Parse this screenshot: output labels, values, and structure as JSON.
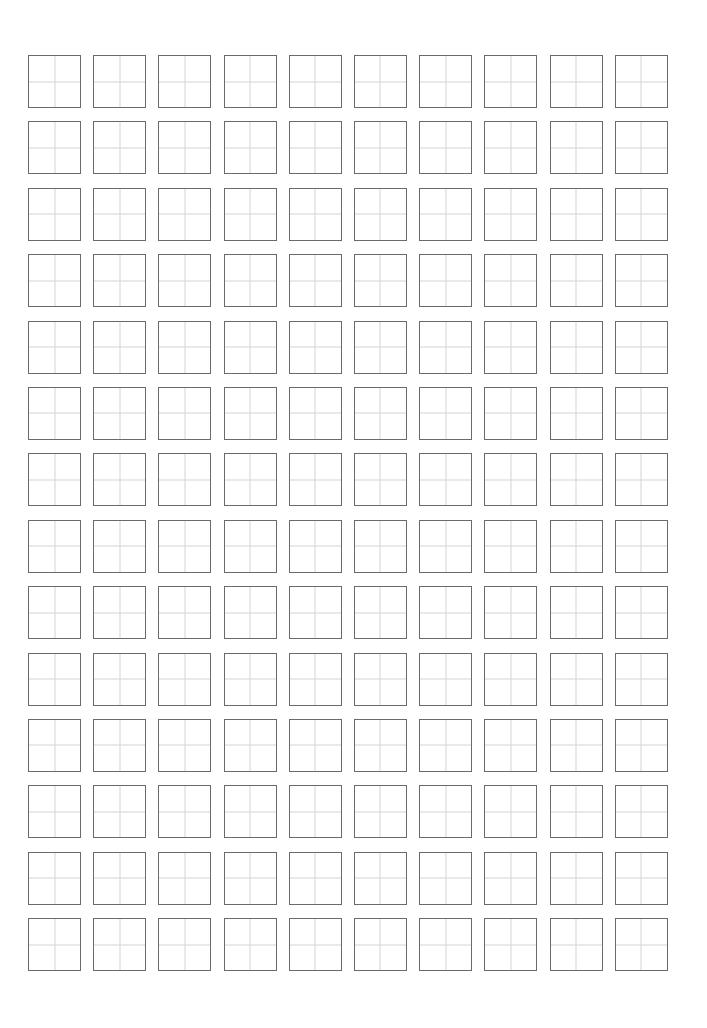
{
  "worksheet": {
    "type": "tianzige-practice-grid",
    "rows": 14,
    "columns": 10,
    "cell_content": "",
    "colors": {
      "background": "#ffffff",
      "cell_border": "#6a6a6a",
      "guide_lines": "#d4d4d4"
    }
  }
}
